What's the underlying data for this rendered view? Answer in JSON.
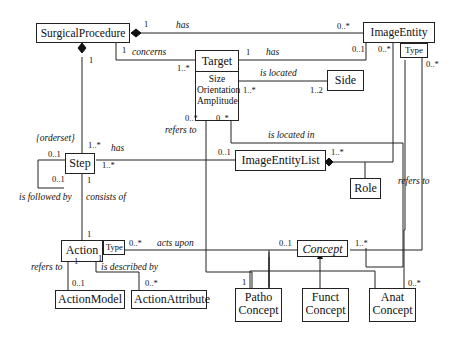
{
  "diagram": {
    "type": "UML class diagram",
    "classes": {
      "surgical_procedure": "SurgicalProcedure",
      "image_entity": "ImageEntity",
      "target": "Target",
      "target_attrs": [
        "Size",
        "Orientation",
        "Amplitude"
      ],
      "side": "Side",
      "step": "Step",
      "image_entity_list": "ImageEntityList",
      "role": "Role",
      "action": "Action",
      "concept": "Concept",
      "action_model": "ActionModel",
      "action_attribute": "ActionAttribute",
      "patho_concept": [
        "Patho",
        "Concept"
      ],
      "funct_concept": [
        "Funct",
        "Concept"
      ],
      "anat_concept": [
        "Anat",
        "Concept"
      ]
    },
    "qualifiers": {
      "image_entity_type": "Type",
      "action_type": "Type"
    },
    "constraints": {
      "orderset": "{orderset}"
    },
    "associations": [
      {
        "from": "SurgicalProcedure",
        "to": "ImageEntity",
        "label": "has",
        "from_mult": "1",
        "to_mult": "0..*",
        "kind": "composition"
      },
      {
        "from": "SurgicalProcedure",
        "to": "Target",
        "label": "concerns",
        "from_mult": "1",
        "to_mult": "1..*"
      },
      {
        "from": "Target",
        "to": "ImageEntity",
        "label": "has",
        "from_mult": "1",
        "to_mult": "0..1"
      },
      {
        "from": "Target",
        "to": "Side",
        "label": "is located",
        "from_mult": "1..*",
        "to_mult": "1..2"
      },
      {
        "from": "Target",
        "to": "PathoConcept",
        "label": "refers to",
        "from_mult": "0..*",
        "to_mult": "1"
      },
      {
        "from": "Target",
        "to": "ImageEntityList",
        "label": "is located in",
        "from_mult": "0..*",
        "to_mult": "1..*"
      },
      {
        "from": "SurgicalProcedure",
        "to": "Step",
        "label": "",
        "from_mult": "1",
        "to_mult": "1..*",
        "kind": "composition"
      },
      {
        "from": "Step",
        "to": "ImageEntityList",
        "label": "has",
        "from_mult": "1..*",
        "to_mult": "0..1"
      },
      {
        "from": "ImageEntity",
        "to": "ImageEntityList",
        "label": "",
        "from_mult": "0..*",
        "to_mult": "1..*",
        "kind": "composition"
      },
      {
        "from": "ImageEntity",
        "to": "AnatConcept",
        "label": "refers to",
        "from_mult": "0..*",
        "to_mult": "0..*"
      },
      {
        "from": "Step",
        "to": "Step",
        "label": "is followed by",
        "from_mult": "0..1",
        "to_mult": "0..1"
      },
      {
        "from": "Step",
        "to": "Action",
        "label": "consists of",
        "from_mult": "1",
        "to_mult": "1"
      },
      {
        "from": "Action",
        "to": "Concept",
        "label": "acts upon",
        "from_mult": "0..*",
        "to_mult": "0..1"
      },
      {
        "from": "Concept",
        "to": "ImageEntity",
        "label": "",
        "from_mult": "1..*",
        "to_mult": "0..*"
      },
      {
        "from": "Action",
        "to": "ActionModel",
        "label": "refers to",
        "from_mult": "1",
        "to_mult": "0..1"
      },
      {
        "from": "Action",
        "to": "ActionAttribute",
        "label": "is described by",
        "from_mult": "1",
        "to_mult": "0..*"
      }
    ],
    "labels": {
      "has_top": "has",
      "concerns": "concerns",
      "has_target": "has",
      "is_located": "is located",
      "refers_to_target": "refers to",
      "is_located_in": "is located in",
      "has_step": "has",
      "refers_to_image": "refers to",
      "is_followed_by": "is followed by",
      "consists_of": "consists of",
      "acts_upon": "acts upon",
      "refers_to_action": "refers to",
      "is_described_by": "is described by"
    },
    "multiplicities": {
      "sp_has_1": "1",
      "sp_has_ie": "0..*",
      "sp_concerns_1": "1",
      "target_concerns": "1..*",
      "sp_step_1": "1",
      "target_has_1": "1",
      "ie_has_01": "0..1",
      "ie_list_0star": "0..*",
      "ie_type_0star": "0..*",
      "target_side": "1..*",
      "side_12": "1..2",
      "target_refers_0star": "0..*",
      "target_located_0star": "0..*",
      "step_1star_top": "1..*",
      "step_has_1star": "1..*",
      "step_self_01_top": "0..1",
      "step_self_01_side": "0..1",
      "step_consists_1": "1",
      "action_consists_1": "1",
      "iel_01": "0..1",
      "iel_1star": "1..*",
      "action_0star": "0..*",
      "concept_01": "0..1",
      "concept_1star": "1..*",
      "action_model_1": "1",
      "action_attr_1": "1",
      "action_model_01": "0..1",
      "action_attr_0star": "0..*",
      "patho_1": "1",
      "anat_0star": "0..*"
    }
  }
}
